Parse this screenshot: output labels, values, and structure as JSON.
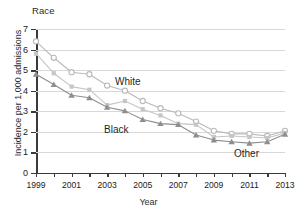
{
  "chart_data": {
    "type": "line",
    "title": "Race",
    "xlabel": "Year",
    "ylabel": "Incidence per 1,000 admissions",
    "x": [
      1999,
      2000,
      2001,
      2002,
      2003,
      2004,
      2005,
      2006,
      2007,
      2008,
      2009,
      2010,
      2011,
      2012,
      2013
    ],
    "xtick_labels": [
      "1999",
      "2001",
      "2003",
      "2005",
      "2007",
      "2009",
      "2011",
      "2013"
    ],
    "xtick_values": [
      1999,
      2001,
      2003,
      2005,
      2007,
      2009,
      2011,
      2013
    ],
    "xlim": [
      1999,
      2013
    ],
    "ytick_labels": [
      "0",
      "1",
      "2",
      "3",
      "4",
      "5",
      "6",
      "7"
    ],
    "ytick_values": [
      0,
      1,
      2,
      3,
      4,
      5,
      6,
      7
    ],
    "ylim": [
      0,
      7
    ],
    "grid": "horizontal",
    "legend_position": "inline-annotations",
    "series": [
      {
        "name": "White",
        "marker": "open-circle",
        "color": "#b9b9b9",
        "values": [
          6.4,
          5.6,
          4.9,
          4.8,
          4.25,
          4.0,
          3.5,
          3.15,
          2.9,
          2.5,
          2.05,
          1.9,
          1.9,
          1.8,
          2.05
        ]
      },
      {
        "name": "Other",
        "marker": "filled-square",
        "color": "#c6c6c6",
        "values": [
          5.8,
          4.85,
          4.2,
          4.05,
          3.3,
          3.5,
          3.1,
          2.8,
          2.4,
          2.35,
          1.75,
          1.8,
          1.75,
          1.7,
          1.95
        ]
      },
      {
        "name": "Black",
        "marker": "filled-triangle",
        "color": "#8e8e8e",
        "values": [
          4.8,
          4.3,
          3.78,
          3.66,
          3.2,
          3.02,
          2.6,
          2.4,
          2.35,
          1.85,
          1.6,
          1.52,
          1.45,
          1.52,
          1.88
        ]
      }
    ],
    "annotations": [
      {
        "text": "White",
        "series": "White"
      },
      {
        "text": "Black",
        "series": "Black"
      },
      {
        "text": "Other",
        "series": "Other"
      }
    ]
  }
}
